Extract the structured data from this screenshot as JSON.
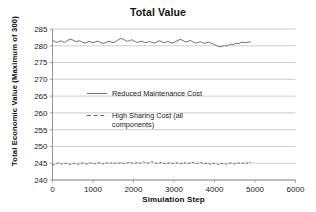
{
  "chart_data": {
    "type": "line",
    "title": "Total Value",
    "xlabel": "Simulation Step",
    "ylabel": "Total Economic Value (Maximum of 300)",
    "xlim": [
      0,
      6000
    ],
    "ylim": [
      240,
      285
    ],
    "xticks": [
      0,
      1000,
      2000,
      3000,
      4000,
      5000,
      6000
    ],
    "yticks": [
      240,
      245,
      250,
      255,
      260,
      265,
      270,
      275,
      280,
      285
    ],
    "xtick_labels": [
      "0",
      "1000",
      "2000",
      "3000",
      "4000",
      "5000",
      "6000"
    ],
    "ytick_labels": [
      "240",
      "245",
      "250",
      "255",
      "260",
      "265",
      "270",
      "275",
      "280",
      "285"
    ],
    "grid": "horizontal",
    "legend_position": "inside-center-left",
    "series": [
      {
        "name": "Reduced Maintenance Cost",
        "style": "solid",
        "color": "#6e6e6e",
        "x": [
          0,
          50,
          100,
          150,
          200,
          250,
          300,
          350,
          400,
          450,
          500,
          550,
          600,
          650,
          700,
          750,
          800,
          850,
          900,
          950,
          1000,
          1050,
          1100,
          1150,
          1200,
          1250,
          1300,
          1350,
          1400,
          1450,
          1500,
          1550,
          1600,
          1650,
          1700,
          1750,
          1800,
          1850,
          1900,
          1950,
          2000,
          2050,
          2100,
          2150,
          2200,
          2250,
          2300,
          2350,
          2400,
          2450,
          2500,
          2550,
          2600,
          2650,
          2700,
          2750,
          2800,
          2850,
          2900,
          2950,
          3000,
          3050,
          3100,
          3150,
          3200,
          3250,
          3300,
          3350,
          3400,
          3450,
          3500,
          3550,
          3600,
          3650,
          3700,
          3750,
          3800,
          3850,
          3900,
          3950,
          4000,
          4050,
          4100,
          4150,
          4200,
          4250,
          4300,
          4350,
          4400,
          4450,
          4500,
          4550,
          4600,
          4650,
          4700,
          4750,
          4800,
          4850,
          4900
        ],
        "values": [
          281.6,
          281.3,
          281.0,
          281.2,
          281.5,
          281.2,
          281.0,
          281.4,
          281.8,
          282.0,
          281.7,
          281.4,
          281.2,
          281.5,
          281.3,
          281.0,
          280.8,
          281.0,
          281.3,
          281.1,
          280.9,
          281.1,
          281.4,
          281.2,
          280.9,
          280.7,
          280.9,
          281.2,
          281.4,
          281.1,
          280.9,
          281.2,
          281.6,
          282.0,
          282.2,
          281.9,
          281.6,
          281.3,
          281.5,
          281.8,
          281.5,
          281.2,
          281.0,
          281.2,
          281.4,
          281.1,
          280.9,
          281.1,
          281.3,
          281.0,
          280.8,
          281.0,
          281.3,
          281.5,
          281.2,
          280.9,
          281.1,
          281.3,
          281.0,
          280.8,
          281.0,
          281.3,
          281.6,
          281.9,
          281.7,
          281.4,
          281.1,
          281.3,
          281.6,
          281.3,
          281.0,
          280.8,
          281.0,
          281.2,
          280.9,
          280.7,
          280.9,
          281.1,
          280.8,
          280.6,
          280.4,
          280.1,
          279.8,
          279.7,
          279.9,
          280.1,
          279.9,
          280.2,
          280.5,
          280.3,
          280.6,
          280.8,
          280.6,
          280.9,
          281.1,
          280.9,
          281.0,
          281.2,
          281.0
        ]
      },
      {
        "name": "High Sharing Cost (all components)",
        "style": "dashed",
        "color": "#6e6e6e",
        "x": [
          0,
          50,
          100,
          150,
          200,
          250,
          300,
          350,
          400,
          450,
          500,
          550,
          600,
          650,
          700,
          750,
          800,
          850,
          900,
          950,
          1000,
          1050,
          1100,
          1150,
          1200,
          1250,
          1300,
          1350,
          1400,
          1450,
          1500,
          1550,
          1600,
          1650,
          1700,
          1750,
          1800,
          1850,
          1900,
          1950,
          2000,
          2050,
          2100,
          2150,
          2200,
          2250,
          2300,
          2350,
          2400,
          2450,
          2500,
          2550,
          2600,
          2650,
          2700,
          2750,
          2800,
          2850,
          2900,
          2950,
          3000,
          3050,
          3100,
          3150,
          3200,
          3250,
          3300,
          3350,
          3400,
          3450,
          3500,
          3550,
          3600,
          3650,
          3700,
          3750,
          3800,
          3850,
          3900,
          3950,
          4000,
          4050,
          4100,
          4150,
          4200,
          4250,
          4300,
          4350,
          4400,
          4450,
          4500,
          4550,
          4600,
          4650,
          4700,
          4750,
          4800,
          4850,
          4900
        ],
        "values": [
          244.4,
          244.6,
          244.9,
          245.1,
          244.9,
          244.7,
          244.9,
          245.0,
          244.8,
          244.6,
          244.8,
          245.0,
          244.8,
          244.7,
          244.9,
          245.1,
          244.9,
          244.7,
          244.9,
          245.1,
          245.0,
          244.8,
          245.0,
          245.2,
          245.0,
          244.8,
          245.0,
          245.1,
          244.9,
          245.1,
          245.2,
          245.0,
          244.9,
          245.1,
          245.2,
          245.0,
          244.9,
          245.1,
          245.3,
          245.1,
          244.9,
          245.1,
          245.2,
          245.0,
          245.2,
          245.4,
          245.2,
          245.0,
          245.2,
          245.5,
          245.3,
          245.1,
          244.9,
          245.1,
          245.2,
          245.0,
          244.8,
          245.0,
          245.2,
          245.0,
          244.9,
          245.1,
          245.0,
          244.8,
          245.0,
          245.2,
          245.0,
          244.9,
          245.1,
          245.3,
          245.1,
          244.9,
          245.0,
          245.2,
          245.0,
          244.8,
          245.0,
          244.9,
          244.7,
          244.9,
          245.0,
          244.8,
          244.6,
          244.8,
          245.0,
          244.8,
          244.7,
          244.9,
          245.1,
          244.9,
          244.8,
          245.0,
          245.1,
          244.9,
          245.0,
          245.2,
          245.0,
          245.1,
          245.3
        ]
      }
    ],
    "legend": [
      {
        "label": "Reduced Maintenance Cost",
        "style": "solid",
        "color": "#6e6e6e"
      },
      {
        "label": "High Sharing Cost (all",
        "label_line2": "components)",
        "style": "dashed",
        "color": "#6e6e6e"
      }
    ]
  },
  "colors": {
    "background": "#ffffff",
    "gridline": "#b9b9b9",
    "axis": "#8a8a8a",
    "series": "#6e6e6e",
    "text": "#111111"
  }
}
